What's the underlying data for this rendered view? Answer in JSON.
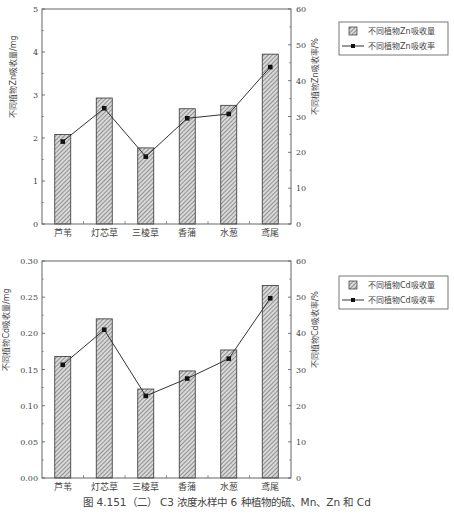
{
  "caption": "图 4.151（二）  C3 浓度水样中 6 种植物的硫、Mn、Zn 和 Cd",
  "chart_data": [
    {
      "type": "bar+line",
      "id": "zn",
      "categories": [
        "芦苇",
        "灯芯草",
        "三棱草",
        "香蒲",
        "水葱",
        "鸢尾"
      ],
      "series": [
        {
          "name": "不同植物Zn吸收量",
          "kind": "bar",
          "axis": "left",
          "values": [
            2.08,
            2.93,
            1.77,
            2.68,
            2.76,
            3.95
          ]
        },
        {
          "name": "不同植物Zn吸收率",
          "kind": "line",
          "axis": "right",
          "values": [
            23.0,
            32.3,
            18.8,
            29.5,
            30.7,
            43.8
          ]
        }
      ],
      "ylabel": "不同植物Zn吸收量/mg",
      "y2label": "不同植物Zn吸收率/%",
      "ylim": [
        0,
        5
      ],
      "y2lim": [
        0,
        60
      ],
      "yticks": [
        "0",
        "1",
        "2",
        "3",
        "4",
        "5"
      ],
      "yticks_values": [
        0,
        1,
        2,
        3,
        4,
        5
      ],
      "y2ticks": [
        "0",
        "10",
        "20",
        "30",
        "40",
        "50",
        "60"
      ],
      "y2ticks_values": [
        0,
        10,
        20,
        30,
        40,
        50,
        60
      ],
      "legend_position": "right-outside-top",
      "grid": false
    },
    {
      "type": "bar+line",
      "id": "cd",
      "categories": [
        "芦苇",
        "灯芯草",
        "三棱草",
        "香蒲",
        "水葱",
        "鸢尾"
      ],
      "series": [
        {
          "name": "不同植物Cd吸收量",
          "kind": "bar",
          "axis": "left",
          "values": [
            0.168,
            0.22,
            0.123,
            0.148,
            0.177,
            0.266
          ]
        },
        {
          "name": "不同植物Cd吸收率",
          "kind": "line",
          "axis": "right",
          "values": [
            31.3,
            41.0,
            22.7,
            27.5,
            33.0,
            49.7
          ]
        }
      ],
      "ylabel": "不同植物Cd吸收量/mg",
      "y2label": "不同植物Cd吸收率/%",
      "ylim": [
        0,
        0.3
      ],
      "y2lim": [
        0,
        60
      ],
      "yticks": [
        "0.00",
        "0.05",
        "0.10",
        "0.15",
        "0.20",
        "0.25",
        "0.30"
      ],
      "yticks_values": [
        0,
        0.05,
        0.1,
        0.15,
        0.2,
        0.25,
        0.3
      ],
      "y2ticks": [
        "0",
        "10",
        "20",
        "30",
        "40",
        "50",
        "60"
      ],
      "y2ticks_values": [
        0,
        10,
        20,
        30,
        40,
        50,
        60
      ],
      "legend_position": "right-outside-top",
      "grid": false
    }
  ],
  "colors": {
    "axis": "#555555",
    "bar_fill": "#d8d8d8",
    "bar_hatch": "#555555",
    "bar_border": "#333333",
    "line": "#333333",
    "marker": "#111111"
  }
}
